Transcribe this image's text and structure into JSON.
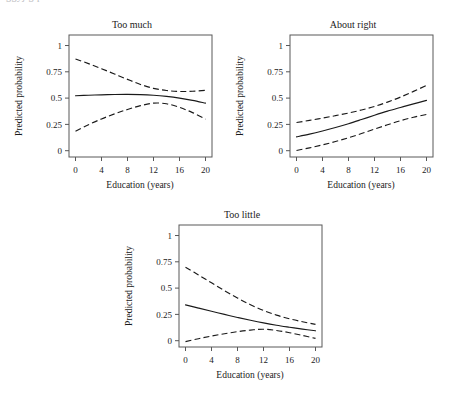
{
  "figure": {
    "y_axis_label": "Predicted probability",
    "x_axis_label": "Education (years)",
    "x_ticks": [
      "0",
      "4",
      "8",
      "12",
      "16",
      "20"
    ],
    "y_ticks": [
      "0",
      "0.25",
      "0.5",
      "0.75",
      "1"
    ],
    "top_cropped_text": "ggyj g p"
  },
  "panels": [
    {
      "title": "Too much"
    },
    {
      "title": "About right"
    },
    {
      "title": "Too little"
    }
  ],
  "chart_data": [
    {
      "type": "line",
      "title": "Too much",
      "xlabel": "Education (years)",
      "ylabel": "Predicted probability",
      "xlim": [
        -1,
        21
      ],
      "ylim": [
        -0.06,
        1.1
      ],
      "xticks": [
        0,
        4,
        8,
        12,
        16,
        20
      ],
      "yticks": [
        0,
        0.25,
        0.5,
        0.75,
        1
      ],
      "grid": false,
      "legend": "none",
      "x": [
        0,
        2,
        4,
        6,
        8,
        10,
        12,
        14,
        16,
        18,
        20
      ],
      "series": [
        {
          "name": "Predicted probability",
          "style": "solid",
          "values": [
            0.522,
            0.527,
            0.531,
            0.534,
            0.535,
            0.533,
            0.527,
            0.516,
            0.5,
            0.478,
            0.452
          ]
        },
        {
          "name": "Upper 95% CI",
          "style": "dashed",
          "values": [
            0.872,
            0.828,
            0.78,
            0.729,
            0.678,
            0.63,
            0.593,
            0.572,
            0.563,
            0.565,
            0.574
          ]
        },
        {
          "name": "Lower 95% CI",
          "style": "dashed",
          "values": [
            0.185,
            0.247,
            0.302,
            0.35,
            0.392,
            0.428,
            0.452,
            0.446,
            0.412,
            0.362,
            0.3
          ]
        }
      ]
    },
    {
      "type": "line",
      "title": "About right",
      "xlabel": "Education (years)",
      "ylabel": "Predicted probability",
      "xlim": [
        -1,
        21
      ],
      "ylim": [
        -0.06,
        1.1
      ],
      "xticks": [
        0,
        4,
        8,
        12,
        16,
        20
      ],
      "yticks": [
        0,
        0.25,
        0.5,
        0.75,
        1
      ],
      "grid": false,
      "legend": "none",
      "x": [
        0,
        2,
        4,
        6,
        8,
        10,
        12,
        14,
        16,
        18,
        20
      ],
      "series": [
        {
          "name": "Predicted probability",
          "style": "solid",
          "values": [
            0.131,
            0.157,
            0.187,
            0.22,
            0.256,
            0.296,
            0.337,
            0.376,
            0.411,
            0.445,
            0.478
          ]
        },
        {
          "name": "Upper 95% CI",
          "style": "dashed",
          "values": [
            0.268,
            0.288,
            0.31,
            0.333,
            0.358,
            0.387,
            0.421,
            0.462,
            0.51,
            0.564,
            0.62
          ]
        },
        {
          "name": "Lower 95% CI",
          "style": "dashed",
          "values": [
            0.002,
            0.027,
            0.055,
            0.087,
            0.123,
            0.163,
            0.205,
            0.246,
            0.285,
            0.318,
            0.345
          ]
        }
      ]
    },
    {
      "type": "line",
      "title": "Too little",
      "xlabel": "Education (years)",
      "ylabel": "Predicted probability",
      "xlim": [
        -1,
        21
      ],
      "ylim": [
        -0.06,
        1.1
      ],
      "xticks": [
        0,
        4,
        8,
        12,
        16,
        20
      ],
      "yticks": [
        0,
        0.25,
        0.5,
        0.75,
        1
      ],
      "grid": false,
      "legend": "none",
      "x": [
        0,
        2,
        4,
        6,
        8,
        10,
        12,
        14,
        16,
        18,
        20
      ],
      "series": [
        {
          "name": "Predicted probability",
          "style": "solid",
          "values": [
            0.341,
            0.31,
            0.28,
            0.25,
            0.221,
            0.194,
            0.169,
            0.147,
            0.128,
            0.11,
            0.094
          ]
        },
        {
          "name": "Upper 95% CI",
          "style": "dashed",
          "values": [
            0.698,
            0.625,
            0.55,
            0.476,
            0.406,
            0.342,
            0.287,
            0.243,
            0.208,
            0.18,
            0.155
          ]
        },
        {
          "name": "Lower 95% CI",
          "style": "dashed",
          "values": [
            -0.009,
            0.019,
            0.044,
            0.066,
            0.086,
            0.101,
            0.109,
            0.097,
            0.076,
            0.05,
            0.022
          ]
        }
      ]
    }
  ]
}
